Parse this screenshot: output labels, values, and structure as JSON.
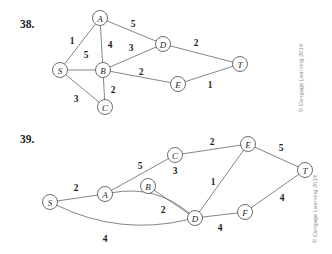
{
  "page": {
    "width": 332,
    "height": 254,
    "background_color": "#ffffff",
    "ink_color": "#1f1f1f",
    "edge_color": "#6f6f6f",
    "node_fill_color": "#ffffff",
    "copyright_color": "#8a8a8a"
  },
  "figures": [
    {
      "id": "figure-38",
      "number_label": "38.",
      "number_pos": {
        "x": 20,
        "y": 28
      },
      "copyright": {
        "text": "© Cengage Learning 2014",
        "x": 303,
        "y": 112,
        "rotation": -90
      },
      "graph": {
        "node_radius": 7.5,
        "nodes": [
          {
            "id": "S",
            "label": "S",
            "x": 60,
            "y": 70
          },
          {
            "id": "A",
            "label": "A",
            "x": 100,
            "y": 18
          },
          {
            "id": "B",
            "label": "B",
            "x": 103,
            "y": 70
          },
          {
            "id": "C",
            "label": "C",
            "x": 105,
            "y": 107
          },
          {
            "id": "D",
            "label": "D",
            "x": 163,
            "y": 44
          },
          {
            "id": "E",
            "label": "E",
            "x": 178,
            "y": 84
          },
          {
            "id": "T",
            "label": "T",
            "x": 240,
            "y": 64
          }
        ],
        "edges": [
          {
            "from": "S",
            "to": "A",
            "weight": "1",
            "label_x": 72,
            "label_y": 41,
            "curved": false
          },
          {
            "from": "S",
            "to": "B",
            "weight": "5",
            "label_x": 86,
            "label_y": 55,
            "curved": false
          },
          {
            "from": "S",
            "to": "C",
            "weight": "3",
            "label_x": 76,
            "label_y": 99,
            "curved": false
          },
          {
            "from": "A",
            "to": "B",
            "weight": "4",
            "label_x": 110,
            "label_y": 45,
            "curved": false
          },
          {
            "from": "A",
            "to": "D",
            "weight": "5",
            "label_x": 133,
            "label_y": 24,
            "curved": false
          },
          {
            "from": "B",
            "to": "D",
            "weight": "3",
            "label_x": 131,
            "label_y": 48,
            "curved": false
          },
          {
            "from": "B",
            "to": "C",
            "weight": "2",
            "label_x": 113,
            "label_y": 90,
            "curved": false
          },
          {
            "from": "B",
            "to": "E",
            "weight": "2",
            "label_x": 141,
            "label_y": 72,
            "curved": false
          },
          {
            "from": "D",
            "to": "T",
            "weight": "2",
            "label_x": 196,
            "label_y": 43,
            "curved": false
          },
          {
            "from": "E",
            "to": "T",
            "weight": "1",
            "label_x": 210,
            "label_y": 85,
            "curved": false
          }
        ]
      }
    },
    {
      "id": "figure-39",
      "number_label": "39.",
      "number_pos": {
        "x": 20,
        "y": 143
      },
      "copyright": {
        "text": "© Cengage Learning 2014",
        "x": 317,
        "y": 243,
        "rotation": -90
      },
      "graph": {
        "node_radius": 7.5,
        "nodes": [
          {
            "id": "S",
            "label": "S",
            "x": 50,
            "y": 202
          },
          {
            "id": "A",
            "label": "A",
            "x": 105,
            "y": 194
          },
          {
            "id": "B",
            "label": "B",
            "x": 148,
            "y": 186
          },
          {
            "id": "C",
            "label": "C",
            "x": 175,
            "y": 155
          },
          {
            "id": "D",
            "label": "D",
            "x": 195,
            "y": 218
          },
          {
            "id": "E",
            "label": "E",
            "x": 248,
            "y": 144
          },
          {
            "id": "F",
            "label": "F",
            "x": 245,
            "y": 212
          },
          {
            "id": "T",
            "label": "T",
            "x": 305,
            "y": 170
          }
        ],
        "edges": [
          {
            "from": "S",
            "to": "A",
            "weight": "2",
            "label_x": 76,
            "label_y": 188,
            "curved": false
          },
          {
            "from": "S",
            "to": "D",
            "weight": "4",
            "label_x": 105,
            "label_y": 239,
            "curved": true,
            "bow": 26
          },
          {
            "from": "A",
            "to": "C",
            "weight": "5",
            "label_x": 140,
            "label_y": 166,
            "curved": false
          },
          {
            "from": "A",
            "to": "D",
            "weight": "3",
            "label_x": 175,
            "label_y": 171,
            "curved": true,
            "bow": -22
          },
          {
            "from": "B",
            "to": "D",
            "weight": "2",
            "label_x": 163,
            "label_y": 210,
            "curved": false
          },
          {
            "from": "C",
            "to": "E",
            "weight": "2",
            "label_x": 212,
            "label_y": 142,
            "curved": false
          },
          {
            "from": "D",
            "to": "E",
            "weight": "1",
            "label_x": 213,
            "label_y": 182,
            "curved": false
          },
          {
            "from": "E",
            "to": "T",
            "weight": "5",
            "label_x": 281,
            "label_y": 148,
            "curved": false
          },
          {
            "from": "D",
            "to": "F",
            "weight": "4",
            "label_x": 220,
            "label_y": 228,
            "curved": false
          },
          {
            "from": "F",
            "to": "T",
            "weight": "4",
            "label_x": 282,
            "label_y": 198,
            "curved": false
          }
        ]
      }
    }
  ]
}
